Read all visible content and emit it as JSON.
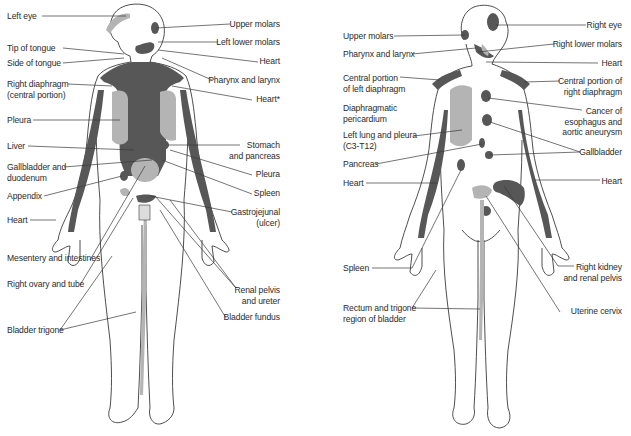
{
  "figure": {
    "colors": {
      "dark_area": "#575757",
      "light_area": "#b4b4b4",
      "outline": "#3a3a3a",
      "leader_line": "#3a3a3a",
      "text": "#2b2b2b",
      "background": "#ffffff"
    },
    "anterior": {
      "view": "front",
      "labels_left": [
        {
          "text": "Left eye",
          "x": 7,
          "y": 11
        },
        {
          "text": "Tip of tongue",
          "x": 7,
          "y": 43
        },
        {
          "text": "Side of tongue",
          "x": 7,
          "y": 58
        },
        {
          "text": "Right diaphragm\n(central portion)",
          "x": 7,
          "y": 79
        },
        {
          "text": "Pleura",
          "x": 7,
          "y": 115
        },
        {
          "text": "Liver",
          "x": 7,
          "y": 142
        },
        {
          "text": "Gallbladder and\nduodenum",
          "x": 7,
          "y": 162
        },
        {
          "text": "Appendix",
          "x": 7,
          "y": 191
        },
        {
          "text": "Heart",
          "x": 7,
          "y": 215
        },
        {
          "text": "Mesentery and intestines",
          "x": 7,
          "y": 253
        },
        {
          "text": "Right ovary and tube",
          "x": 7,
          "y": 279
        },
        {
          "text": "Bladder trigone",
          "x": 7,
          "y": 325
        }
      ],
      "labels_right": [
        {
          "text": "Upper molars",
          "x": 280,
          "y": 20
        },
        {
          "text": "Left lower molars",
          "x": 280,
          "y": 38
        },
        {
          "text": "Heart",
          "x": 280,
          "y": 57
        },
        {
          "text": "Pharynx and larynx",
          "x": 280,
          "y": 76
        },
        {
          "text": "Heart*",
          "x": 280,
          "y": 95
        },
        {
          "text": "Stomach\nand pancreas",
          "x": 280,
          "y": 138
        },
        {
          "text": "Pleura",
          "x": 280,
          "y": 170
        },
        {
          "text": "Spleen",
          "x": 280,
          "y": 189
        },
        {
          "text": "Gastrojejunal\n(ulcer)",
          "x": 280,
          "y": 205
        },
        {
          "text": "Renal pelvis\nand ureter",
          "x": 280,
          "y": 283
        },
        {
          "text": "Bladder fundus",
          "x": 280,
          "y": 313
        }
      ]
    },
    "posterior": {
      "view": "back",
      "labels_left": [
        {
          "text": "Upper molars",
          "x": 343,
          "y": 31
        },
        {
          "text": "Pharynx and larynx",
          "x": 343,
          "y": 49
        },
        {
          "text": "Central portion\nof left diaphragm",
          "x": 343,
          "y": 72
        },
        {
          "text": "Diaphragmatic\npericardium",
          "x": 343,
          "y": 103
        },
        {
          "text": "Left lung and pleura\n(C3-T12)",
          "x": 343,
          "y": 130
        },
        {
          "text": "Pancreas",
          "x": 343,
          "y": 159
        },
        {
          "text": "Heart",
          "x": 343,
          "y": 178
        },
        {
          "text": "Spleen",
          "x": 343,
          "y": 263
        },
        {
          "text": "Rectum and trigone\nregion of bladder",
          "x": 343,
          "y": 303
        }
      ],
      "labels_right": [
        {
          "text": "Right eye",
          "x": 622,
          "y": 20
        },
        {
          "text": "Right lower molars",
          "x": 622,
          "y": 39
        },
        {
          "text": "Heart",
          "x": 622,
          "y": 58
        },
        {
          "text": "Central portion of\nright diaphragm",
          "x": 622,
          "y": 76
        },
        {
          "text": "Cancer of\nesophagus and\naortic aneurysm",
          "x": 622,
          "y": 106
        },
        {
          "text": "Gallbladder",
          "x": 622,
          "y": 147
        },
        {
          "text": "Heart",
          "x": 622,
          "y": 176
        },
        {
          "text": "Right kidney\nand renal pelvis",
          "x": 622,
          "y": 262
        },
        {
          "text": "Uterine cervix",
          "x": 622,
          "y": 306
        }
      ]
    }
  }
}
